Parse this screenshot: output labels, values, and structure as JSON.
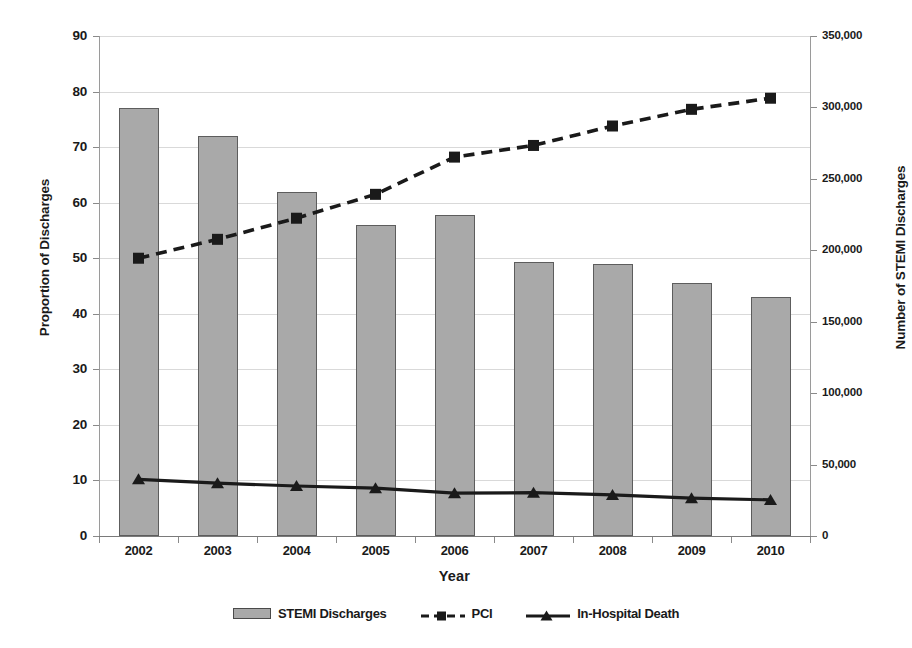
{
  "chart_data": {
    "type": "bar",
    "title": "",
    "subtitle": "",
    "xlabel": "Year",
    "ylabel": "Proportion of Discharges",
    "y2label": "Number of STEMI Discharges",
    "categories": [
      "2002",
      "2003",
      "2004",
      "2005",
      "2006",
      "2007",
      "2008",
      "2009",
      "2010"
    ],
    "ylim": [
      0,
      90
    ],
    "y2lim": [
      0,
      350000
    ],
    "yticks": [
      "0",
      "10",
      "20",
      "30",
      "40",
      "50",
      "60",
      "70",
      "80",
      "90"
    ],
    "y2ticks": [
      "0",
      "50,000",
      "100,000",
      "150,000",
      "200,000",
      "250,000",
      "300,000",
      "350,000"
    ],
    "grid": true,
    "legend_position": "bottom",
    "series": [
      {
        "name": "STEMI Discharges",
        "type": "bar",
        "axis": "right",
        "units": "discharges",
        "values": [
          299000,
          280000,
          241000,
          218000,
          224000,
          192000,
          190000,
          177000,
          167000
        ],
        "proportion_scale_values": [
          77.0,
          72.0,
          62.0,
          56.0,
          57.7,
          49.3,
          49.0,
          45.5,
          43.0
        ],
        "color": "#a9a9a9",
        "edge_color": "#5d5d5d"
      },
      {
        "name": "PCI",
        "type": "line",
        "axis": "left",
        "units": "percent",
        "values": [
          50.0,
          53.4,
          57.2,
          61.5,
          68.2,
          70.3,
          73.8,
          76.8,
          78.8
        ],
        "line_style": "dashed",
        "marker": "square",
        "color": "#1a1a1a"
      },
      {
        "name": "In-Hospital Death",
        "type": "line",
        "axis": "left",
        "units": "percent",
        "values": [
          10.2,
          9.5,
          9.0,
          8.6,
          7.7,
          7.8,
          7.4,
          6.8,
          6.5
        ],
        "line_style": "solid",
        "marker": "triangle",
        "color": "#1a1a1a"
      }
    ]
  },
  "legend": {
    "items": [
      {
        "label": "STEMI Discharges",
        "marker": "bar-swatch-icon"
      },
      {
        "label": "PCI",
        "marker": "dashed-square-marker-icon"
      },
      {
        "label": "In-Hospital Death",
        "marker": "solid-triangle-marker-icon"
      }
    ]
  }
}
